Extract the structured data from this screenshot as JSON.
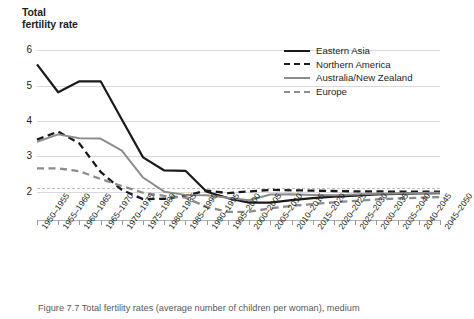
{
  "chart_data": {
    "type": "line",
    "title": "Total\nfertility rate",
    "title_line1": "Total",
    "title_line2": "fertility rate",
    "xlabel": "",
    "ylabel": "Total fertility rate",
    "ylim": [
      1.2,
      6.4
    ],
    "yticks": [
      2,
      3,
      4,
      5,
      6
    ],
    "ytick_labels": [
      "2",
      "3",
      "4",
      "5",
      "6"
    ],
    "grid": true,
    "reference_line": 2.1,
    "legend_position": "top-right",
    "categories": [
      "1950–1955",
      "1955–1960",
      "1960–1965",
      "1965–1970",
      "1970–1975",
      "1975–1980",
      "1980–1985",
      "1985–1990",
      "1990–1995",
      "1995–2000",
      "2000–2005",
      "2005–2010",
      "2010–2015",
      "2015–2020",
      "2020–2025",
      "2025–2030",
      "2030–2035",
      "2035–2040",
      "2040–2045",
      "2045–2050"
    ],
    "series": [
      {
        "name": "Eastern Asia",
        "style": "solid",
        "color": "#1a1a1a",
        "values": [
          5.6,
          4.81,
          5.12,
          5.12,
          4.04,
          2.97,
          2.6,
          2.59,
          2.0,
          1.82,
          1.69,
          1.69,
          1.76,
          1.82,
          1.86,
          1.89,
          1.92,
          1.94,
          1.95,
          1.96
        ]
      },
      {
        "name": "Northern America",
        "style": "dashed",
        "color": "#1a1a1a",
        "values": [
          3.47,
          3.7,
          3.36,
          2.56,
          2.05,
          1.79,
          1.8,
          1.89,
          2.03,
          1.96,
          2.01,
          2.05,
          2.04,
          2.03,
          2.02,
          2.01,
          2.01,
          2.0,
          2.0,
          2.0
        ]
      },
      {
        "name": "Australia/New Zealand",
        "style": "solid",
        "color": "#8c8c8c",
        "values": [
          3.41,
          3.62,
          3.51,
          3.5,
          3.16,
          2.4,
          2.0,
          1.91,
          1.9,
          1.83,
          1.76,
          1.92,
          1.93,
          1.91,
          1.9,
          1.92,
          1.94,
          1.95,
          1.96,
          1.97
        ]
      },
      {
        "name": "Europe",
        "style": "dashed",
        "color": "#8c8c8c",
        "values": [
          2.66,
          2.66,
          2.58,
          2.36,
          2.16,
          1.97,
          1.88,
          1.83,
          1.57,
          1.43,
          1.43,
          1.53,
          1.6,
          1.65,
          1.7,
          1.74,
          1.78,
          1.81,
          1.83,
          1.85
        ]
      }
    ],
    "caption": "Figure 7.7 Total fertility rates (average number of children per woman), medium"
  }
}
